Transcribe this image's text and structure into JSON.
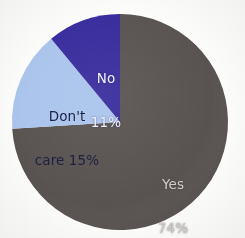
{
  "chart_data": {
    "type": "pie",
    "title": "",
    "subtitle": "",
    "xlabel": "",
    "ylabel": "",
    "legend_position": "none",
    "grid": false,
    "labels_inside_slices": true,
    "start_angle_deg": 0,
    "direction": "clockwise",
    "categories": [
      "Yes",
      "Don't care",
      "No"
    ],
    "values": [
      74,
      15,
      11
    ],
    "unit": "%",
    "slices": [
      {
        "name": "Yes",
        "label_line1": "Yes",
        "label_line2": "74%",
        "value": 74,
        "value_text": "74%",
        "color": "#585351",
        "text_color": "#cfcdc9"
      },
      {
        "name": "Don't care",
        "label_line1": "Don't",
        "label_line2": "care 15%",
        "value": 15,
        "value_text": "15%",
        "color": "#a9c4ec",
        "text_color": "#1c2040"
      },
      {
        "name": "No",
        "label_line1": "No",
        "label_line2": "11%",
        "value": 11,
        "value_text": "11%",
        "color": "#372a9c",
        "text_color": "#f2f2f6"
      }
    ]
  },
  "canvas": {
    "background": "#fdfdfc",
    "center_x": 120,
    "center_y": 122,
    "radius": 108
  }
}
